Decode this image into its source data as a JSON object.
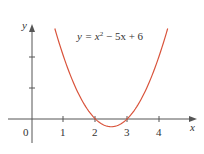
{
  "chart_data": {
    "type": "line",
    "title": "",
    "annotation": "y = x² − 5x + 6",
    "annotation_parts": {
      "lhs": "y = x",
      "exp": "2",
      "rhs": " − 5x + 6"
    },
    "xlabel": "x",
    "ylabel": "y",
    "origin_label": "0",
    "x_ticks": [
      "1",
      "2",
      "3",
      "4"
    ],
    "y_ticks_unlabeled": [
      1,
      2
    ],
    "xlim": [
      -0.8,
      4.7
    ],
    "ylim": [
      -1,
      3.2
    ],
    "grid": false,
    "series": [
      {
        "name": "y = x^2 - 5x + 6",
        "color": "#d9533b",
        "function": "x^2 - 5x + 6",
        "x": [
          0.72,
          1.0,
          1.5,
          2.0,
          2.5,
          3.0,
          3.5,
          4.0,
          4.28
        ],
        "y": [
          2.92,
          2.0,
          0.75,
          0.0,
          -0.25,
          0.0,
          0.75,
          2.0,
          2.92
        ]
      }
    ],
    "roots": [
      2,
      3
    ],
    "vertex": [
      2.5,
      -0.25
    ]
  },
  "colors": {
    "axis": "#555555",
    "curve": "#d9533b",
    "text": "#333333"
  }
}
